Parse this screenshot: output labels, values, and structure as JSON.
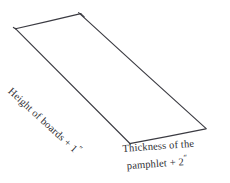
{
  "diagram": {
    "type": "hand-drawn-parallelogram",
    "background_color": "#ffffff",
    "line_color": "#3b3b42",
    "text_color": "#2e2e33",
    "vertices": {
      "top_left": [
        16,
        28
      ],
      "top_right": [
        80,
        14
      ],
      "bottom_right": [
        205,
        128
      ],
      "bottom_left": [
        130,
        143
      ]
    },
    "labels": {
      "long_edge": {
        "full_text": "Height of boards + 1″",
        "text": "Height of boards + 1",
        "unit_mark": "″",
        "rotation_degrees": 42.5
      },
      "short_edge": {
        "full_text": "Thickness of the pamphlet + 2″",
        "line_1": "Thickness of the",
        "line_2_text": "pamphlet + 2",
        "unit_mark": "″",
        "rotation_degrees": -4.2
      }
    }
  }
}
